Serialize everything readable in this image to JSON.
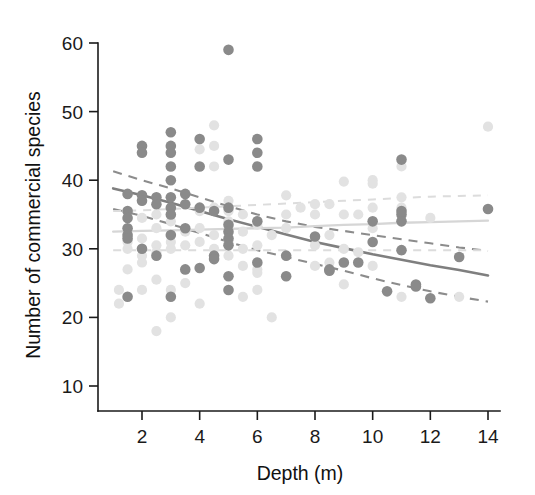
{
  "chart_data": {
    "type": "scatter",
    "title": "",
    "xlabel": "Depth (m)",
    "ylabel": "Number of commercial species",
    "xlim": [
      0.8,
      14.6
    ],
    "ylim": [
      8.5,
      61
    ],
    "xticks": [
      2,
      4,
      6,
      8,
      10,
      12,
      14
    ],
    "yticks": [
      10,
      20,
      30,
      40,
      50,
      60
    ],
    "grid": false,
    "legend": "none",
    "colors": {
      "dark_points": "#8a8a8a",
      "light_points": "#e2e2e2",
      "dark_fit": "#7f7f7f",
      "light_fit": "#d6d6d6",
      "axis": "#1a1a1a",
      "background": "#ffffff"
    },
    "series": [
      {
        "name": "dark-group",
        "marker": "filled-circle",
        "color": "#8a8a8a",
        "points": [
          [
            1.5,
            38.0
          ],
          [
            1.5,
            35.5
          ],
          [
            1.5,
            34.5
          ],
          [
            1.5,
            33.0
          ],
          [
            1.5,
            32.0
          ],
          [
            1.5,
            31.5
          ],
          [
            1.5,
            23.0
          ],
          [
            2.0,
            45.0
          ],
          [
            2.0,
            44.0
          ],
          [
            2.0,
            37.8
          ],
          [
            2.0,
            37.0
          ],
          [
            2.0,
            30.0
          ],
          [
            2.5,
            37.5
          ],
          [
            2.5,
            36.5
          ],
          [
            2.5,
            29.0
          ],
          [
            3.0,
            47.0
          ],
          [
            3.0,
            45.0
          ],
          [
            3.0,
            44.0
          ],
          [
            3.0,
            42.0
          ],
          [
            3.0,
            40.0
          ],
          [
            3.0,
            37.5
          ],
          [
            3.0,
            36.0
          ],
          [
            3.0,
            35.0
          ],
          [
            3.0,
            32.0
          ],
          [
            3.0,
            23.0
          ],
          [
            3.5,
            38.0
          ],
          [
            3.5,
            36.5
          ],
          [
            3.5,
            33.0
          ],
          [
            3.5,
            27.0
          ],
          [
            4.0,
            46.0
          ],
          [
            4.0,
            42.0
          ],
          [
            4.0,
            36.0
          ],
          [
            4.0,
            27.2
          ],
          [
            4.5,
            35.5
          ],
          [
            4.5,
            29.0
          ],
          [
            4.5,
            28.5
          ],
          [
            5.0,
            59.0
          ],
          [
            5.0,
            43.0
          ],
          [
            5.0,
            36.0
          ],
          [
            5.0,
            33.5
          ],
          [
            5.0,
            32.5
          ],
          [
            5.0,
            31.5
          ],
          [
            5.0,
            30.5
          ],
          [
            5.0,
            26.0
          ],
          [
            5.0,
            24.0
          ],
          [
            6.0,
            46.0
          ],
          [
            6.0,
            44.0
          ],
          [
            6.0,
            42.0
          ],
          [
            6.0,
            34.0
          ],
          [
            6.0,
            28.0
          ],
          [
            7.0,
            29.0
          ],
          [
            7.0,
            26.0
          ],
          [
            8.0,
            31.8
          ],
          [
            8.5,
            27.0
          ],
          [
            8.5,
            26.8
          ],
          [
            9.0,
            28.0
          ],
          [
            9.5,
            28.0
          ],
          [
            10.0,
            34.0
          ],
          [
            10.0,
            31.0
          ],
          [
            10.5,
            23.8
          ],
          [
            11.0,
            43.0
          ],
          [
            11.0,
            35.5
          ],
          [
            11.0,
            35.0
          ],
          [
            11.0,
            34.0
          ],
          [
            11.0,
            29.8
          ],
          [
            11.5,
            24.8
          ],
          [
            11.5,
            24.5
          ],
          [
            12.0,
            22.8
          ],
          [
            13.0,
            28.8
          ],
          [
            14.0,
            35.8
          ]
        ]
      },
      {
        "name": "light-group",
        "marker": "filled-circle",
        "color": "#e2e2e2",
        "points": [
          [
            1.2,
            24.0
          ],
          [
            1.2,
            22.0
          ],
          [
            1.5,
            27.0
          ],
          [
            1.5,
            31.0
          ],
          [
            1.5,
            30.0
          ],
          [
            2.0,
            34.5
          ],
          [
            2.0,
            31.5
          ],
          [
            2.0,
            29.0
          ],
          [
            2.0,
            28.0
          ],
          [
            2.0,
            24.0
          ],
          [
            2.5,
            35.0
          ],
          [
            2.5,
            33.0
          ],
          [
            2.5,
            30.5
          ],
          [
            2.5,
            29.5
          ],
          [
            2.5,
            25.5
          ],
          [
            2.5,
            18.0
          ],
          [
            3.0,
            34.0
          ],
          [
            3.0,
            31.0
          ],
          [
            3.0,
            30.0
          ],
          [
            3.0,
            24.0
          ],
          [
            3.0,
            20.0
          ],
          [
            3.5,
            32.5
          ],
          [
            3.5,
            30.5
          ],
          [
            3.5,
            25.0
          ],
          [
            4.0,
            44.5
          ],
          [
            4.0,
            35.5
          ],
          [
            4.0,
            33.0
          ],
          [
            4.0,
            31.0
          ],
          [
            4.0,
            22.0
          ],
          [
            4.5,
            48.0
          ],
          [
            4.5,
            45.0
          ],
          [
            4.5,
            42.0
          ],
          [
            4.5,
            36.0
          ],
          [
            4.5,
            32.0
          ],
          [
            4.5,
            30.0
          ],
          [
            5.0,
            37.0
          ],
          [
            5.0,
            35.5
          ],
          [
            5.0,
            34.0
          ],
          [
            5.0,
            31.0
          ],
          [
            5.0,
            29.0
          ],
          [
            5.5,
            35.0
          ],
          [
            5.5,
            32.5
          ],
          [
            5.5,
            30.0
          ],
          [
            5.5,
            27.5
          ],
          [
            5.5,
            23.0
          ],
          [
            6.0,
            33.5
          ],
          [
            6.0,
            30.5
          ],
          [
            6.0,
            27.0
          ],
          [
            6.0,
            26.5
          ],
          [
            6.0,
            24.0
          ],
          [
            6.5,
            32.0
          ],
          [
            6.5,
            20.0
          ],
          [
            7.0,
            37.8
          ],
          [
            7.0,
            35.0
          ],
          [
            7.0,
            33.0
          ],
          [
            7.0,
            26.0
          ],
          [
            7.5,
            36.0
          ],
          [
            8.0,
            36.5
          ],
          [
            8.0,
            35.0
          ],
          [
            8.0,
            30.5
          ],
          [
            8.0,
            27.5
          ],
          [
            8.5,
            36.5
          ],
          [
            8.5,
            32.0
          ],
          [
            8.5,
            28.0
          ],
          [
            9.0,
            39.8
          ],
          [
            9.0,
            35.0
          ],
          [
            9.0,
            30.0
          ],
          [
            9.0,
            24.8
          ],
          [
            9.5,
            35.0
          ],
          [
            9.5,
            29.5
          ],
          [
            10.0,
            40.0
          ],
          [
            10.0,
            39.5
          ],
          [
            10.0,
            36.0
          ],
          [
            10.0,
            33.0
          ],
          [
            10.0,
            27.5
          ],
          [
            11.0,
            42.0
          ],
          [
            11.0,
            37.5
          ],
          [
            11.0,
            36.0
          ],
          [
            11.0,
            34.0
          ],
          [
            11.0,
            23.0
          ],
          [
            12.0,
            34.5
          ],
          [
            13.0,
            23.0
          ],
          [
            14.0,
            47.8
          ]
        ]
      }
    ],
    "fits": [
      {
        "name": "dark-fit-mean",
        "style": "solid",
        "color": "#7f7f7f",
        "points": [
          [
            1.0,
            38.8
          ],
          [
            2.0,
            37.8
          ],
          [
            3.0,
            36.7
          ],
          [
            4.0,
            35.5
          ],
          [
            5.0,
            34.3
          ],
          [
            6.0,
            33.2
          ],
          [
            7.0,
            32.1
          ],
          [
            8.0,
            31.0
          ],
          [
            9.0,
            30.1
          ],
          [
            10.0,
            29.2
          ],
          [
            11.0,
            28.4
          ],
          [
            12.0,
            27.6
          ],
          [
            13.0,
            26.9
          ],
          [
            14.0,
            26.1
          ]
        ]
      },
      {
        "name": "dark-fit-upper",
        "style": "dashed",
        "color": "#8c8c8c",
        "points": [
          [
            1.0,
            41.3
          ],
          [
            2.0,
            40.0
          ],
          [
            3.0,
            38.8
          ],
          [
            4.0,
            37.5
          ],
          [
            5.0,
            36.2
          ],
          [
            6.0,
            35.0
          ],
          [
            7.0,
            34.0
          ],
          [
            8.0,
            33.2
          ],
          [
            9.0,
            32.6
          ],
          [
            10.0,
            32.0
          ],
          [
            11.0,
            31.4
          ],
          [
            12.0,
            30.8
          ],
          [
            13.0,
            30.2
          ],
          [
            14.0,
            29.7
          ]
        ]
      },
      {
        "name": "dark-fit-lower",
        "style": "dashed",
        "color": "#8c8c8c",
        "points": [
          [
            1.0,
            35.8
          ],
          [
            2.0,
            34.8
          ],
          [
            3.0,
            33.6
          ],
          [
            4.0,
            32.3
          ],
          [
            5.0,
            31.0
          ],
          [
            6.0,
            29.8
          ],
          [
            7.0,
            28.8
          ],
          [
            8.0,
            27.8
          ],
          [
            9.0,
            26.8
          ],
          [
            10.0,
            25.7
          ],
          [
            11.0,
            24.7
          ],
          [
            12.0,
            23.8
          ],
          [
            13.0,
            23.0
          ],
          [
            14.0,
            22.3
          ]
        ]
      },
      {
        "name": "light-fit-mean",
        "style": "solid",
        "color": "#d6d6d6",
        "points": [
          [
            1.0,
            32.5
          ],
          [
            2.0,
            32.6
          ],
          [
            3.0,
            32.7
          ],
          [
            4.0,
            32.8
          ],
          [
            5.0,
            32.9
          ],
          [
            6.0,
            33.0
          ],
          [
            7.0,
            33.1
          ],
          [
            8.0,
            33.3
          ],
          [
            9.0,
            33.5
          ],
          [
            10.0,
            33.6
          ],
          [
            11.0,
            33.8
          ],
          [
            12.0,
            33.9
          ],
          [
            13.0,
            34.0
          ],
          [
            14.0,
            34.1
          ]
        ]
      },
      {
        "name": "light-fit-upper",
        "style": "dashed",
        "color": "#dcdcdc",
        "points": [
          [
            1.0,
            35.5
          ],
          [
            2.0,
            35.6
          ],
          [
            3.0,
            35.8
          ],
          [
            4.0,
            36.0
          ],
          [
            5.0,
            36.2
          ],
          [
            6.0,
            36.4
          ],
          [
            7.0,
            36.6
          ],
          [
            8.0,
            36.8
          ],
          [
            9.0,
            37.0
          ],
          [
            10.0,
            37.2
          ],
          [
            11.0,
            37.4
          ],
          [
            12.0,
            37.6
          ],
          [
            13.0,
            37.7
          ],
          [
            14.0,
            37.8
          ]
        ]
      },
      {
        "name": "light-fit-lower",
        "style": "dashed",
        "color": "#dcdcdc",
        "points": [
          [
            1.0,
            29.8
          ],
          [
            2.0,
            29.8
          ],
          [
            3.0,
            29.8
          ],
          [
            4.0,
            29.8
          ],
          [
            5.0,
            29.8
          ],
          [
            6.0,
            29.8
          ],
          [
            7.0,
            29.8
          ],
          [
            8.0,
            29.8
          ],
          [
            9.0,
            29.8
          ],
          [
            10.0,
            29.8
          ],
          [
            11.0,
            29.8
          ],
          [
            12.0,
            29.8
          ],
          [
            13.0,
            29.8
          ],
          [
            14.0,
            29.8
          ]
        ]
      }
    ]
  },
  "axes": {
    "x_tick_labels": [
      "2",
      "4",
      "6",
      "8",
      "10",
      "12",
      "14"
    ],
    "y_tick_labels": [
      "10",
      "20",
      "30",
      "40",
      "50",
      "60"
    ],
    "x_title": "Depth (m)",
    "y_title": "Number of commercial species"
  }
}
